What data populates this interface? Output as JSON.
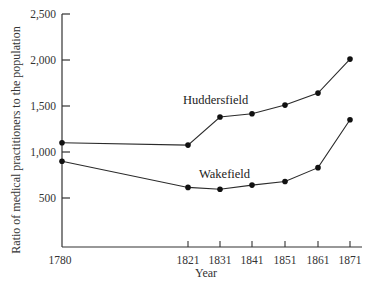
{
  "chart_data": {
    "type": "line",
    "title": "",
    "xlabel": "Year",
    "ylabel": "Ratio of medical practitioners to the population",
    "x": [
      1780,
      1821,
      1831,
      1841,
      1851,
      1861,
      1871
    ],
    "x_tick_labels": [
      "1780",
      "1821",
      "1831",
      "1841",
      "1851",
      "1861",
      "1871"
    ],
    "y_ticks": [
      500,
      1000,
      1500,
      2000,
      2500
    ],
    "y_tick_labels": [
      "500",
      "1,000",
      "1,500",
      "2,000",
      "2,500"
    ],
    "ylim": [
      0,
      2500
    ],
    "grid": false,
    "legend": "inline labels",
    "series": [
      {
        "name": "Huddersfield",
        "values": [
          1100,
          1075,
          1380,
          1415,
          1510,
          1640,
          2010
        ]
      },
      {
        "name": "Wakefield",
        "values": [
          900,
          615,
          595,
          640,
          680,
          830,
          1350
        ]
      }
    ]
  },
  "colors": {
    "line": "#2b2b2b",
    "marker": "#111111",
    "axis": "#333333"
  }
}
